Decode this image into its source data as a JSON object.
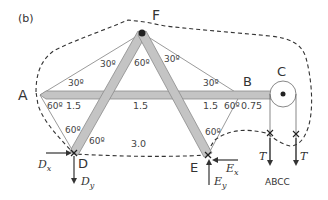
{
  "figure_label": "(b)",
  "points": {
    "A": "A",
    "B": "B",
    "C": "C",
    "D": "D",
    "E": "E",
    "F": "F"
  },
  "angles": {
    "A_upper": "30º",
    "A_lower": "60º",
    "F_left_outer": "30º",
    "F_inner": "60º",
    "F_right_outer": "30º",
    "B_upper": "30º",
    "B_lower": "60º",
    "D_upper": "60º",
    "D_right": "60º",
    "E_upper": "60º"
  },
  "dimensions": {
    "seg_1": "1.5",
    "seg_2": "1.5",
    "seg_3": "1.5",
    "seg_4": "0.75",
    "base": "3.0"
  },
  "forces": {
    "Dx": {
      "main": "D",
      "sub": "x"
    },
    "Dy": {
      "main": "D",
      "sub": "y"
    },
    "Ex": {
      "main": "E",
      "sub": "x"
    },
    "Ey": {
      "main": "E",
      "sub": "y"
    },
    "T_left": "T",
    "T_right": "T"
  },
  "bottom_caption": "ABCC",
  "colors": {
    "member_fill": "#c4c4c4",
    "member_stroke": "#8a8a8a",
    "line": "#333333",
    "dashed": "#333333"
  }
}
